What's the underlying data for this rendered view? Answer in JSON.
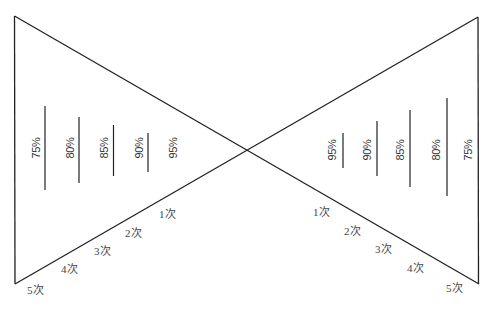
{
  "diagram": {
    "line_color": "#222222",
    "text_color": "#333333",
    "left": {
      "percent_labels": [
        "75%",
        "80%",
        "85%",
        "90%",
        "95%"
      ],
      "times_labels": [
        "1次",
        "2次",
        "3次",
        "4次",
        "5次"
      ]
    },
    "right": {
      "percent_labels": [
        "95%",
        "90%",
        "85%",
        "80%",
        "75%"
      ],
      "times_labels": [
        "1次",
        "2次",
        "3次",
        "4次",
        "5次"
      ]
    }
  }
}
